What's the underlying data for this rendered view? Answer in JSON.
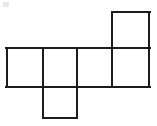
{
  "figure": {
    "name": "cube-net-hexomino",
    "background_color": "#ffffff",
    "stroke_color": "#1c1c1c",
    "fill_color": "#ffffff",
    "stroke_width": 2,
    "canvas": {
      "width": 157,
      "height": 126
    },
    "grid": {
      "x_lines": [
        6,
        43,
        77,
        112,
        150
      ],
      "y_lines": [
        11,
        48,
        87,
        118
      ],
      "cell_width": 37,
      "cell_height": 37
    },
    "squares": [
      {
        "id": "square-top-right",
        "label": "top",
        "x": 112,
        "y": 11,
        "width": 38,
        "height": 37
      },
      {
        "id": "square-row-1",
        "label": "row-left",
        "x": 6,
        "y": 48,
        "width": 37,
        "height": 39
      },
      {
        "id": "square-row-2",
        "label": "row-second",
        "x": 43,
        "y": 48,
        "width": 34,
        "height": 39
      },
      {
        "id": "square-row-3",
        "label": "row-third",
        "x": 77,
        "y": 48,
        "width": 35,
        "height": 39
      },
      {
        "id": "square-row-4",
        "label": "row-right",
        "x": 112,
        "y": 48,
        "width": 38,
        "height": 39
      },
      {
        "id": "square-bottom",
        "label": "bottom",
        "x": 43,
        "y": 87,
        "width": 34,
        "height": 31
      }
    ],
    "artifact": {
      "id": "corner-speck",
      "x": 3,
      "y": 2,
      "width": 6,
      "height": 5
    }
  }
}
